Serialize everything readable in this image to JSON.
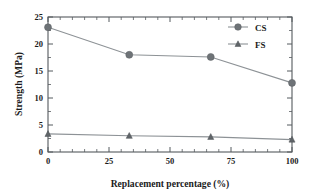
{
  "chart_data": {
    "type": "line",
    "title": "",
    "xlabel": "Replacement percentage (%)",
    "ylabel": "Strength (MPa)",
    "xlim": [
      0,
      100
    ],
    "ylim": [
      0,
      25
    ],
    "xticks": [
      "0",
      "25",
      "50",
      "75",
      "100"
    ],
    "xtick_values": [
      0,
      25,
      50,
      75,
      100
    ],
    "yticks": [
      "0",
      "5",
      "10",
      "15",
      "20",
      "25"
    ],
    "ytick_values": [
      0,
      5,
      10,
      15,
      20,
      25
    ],
    "x_minor_step": 5,
    "y_minor_step": 2.5,
    "grid": false,
    "legend_position": "top-right-inside",
    "x": [
      0,
      33.3,
      66.7,
      100
    ],
    "series": [
      {
        "name": "CS",
        "marker": "circle",
        "values": [
          23.1,
          18.0,
          17.6,
          12.8
        ]
      },
      {
        "name": "FS",
        "marker": "triangle",
        "values": [
          3.35,
          3.0,
          2.8,
          2.3
        ]
      }
    ]
  },
  "legend": {
    "entries": [
      {
        "label": "CS",
        "marker": "circle-marker-icon"
      },
      {
        "label": "FS",
        "marker": "triangle-marker-icon"
      }
    ]
  },
  "colors": {
    "axis": "#555a5e",
    "line": "#8d9296",
    "marker_cs": "#6e7377",
    "marker_fs": "#5f6468",
    "text": "#1b1b1b",
    "background": "#ffffff"
  }
}
